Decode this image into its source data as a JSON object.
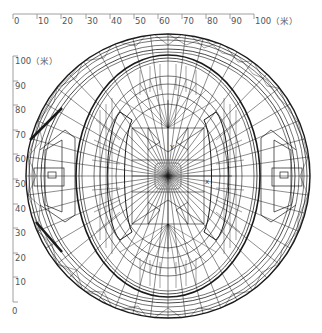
{
  "figure": {
    "type": "wireframe-plan-view",
    "line_color": "#1a1a1a",
    "axis_color": "#888888",
    "background": "#ffffff"
  },
  "top_axis": {
    "ticks": [
      "0",
      "10",
      "20",
      "30",
      "40",
      "50",
      "60",
      "70",
      "80",
      "90",
      "100（米）"
    ],
    "unit": "米"
  },
  "left_axis": {
    "ticks": [
      "100（米）",
      "90",
      "80",
      "70",
      "60",
      "50",
      "40",
      "30",
      "20",
      "10",
      "0"
    ],
    "unit": "米"
  },
  "labels": {
    "y_axis_marker": "Y",
    "z_axis_marker": "Z",
    "x_axis_marker": "X"
  }
}
